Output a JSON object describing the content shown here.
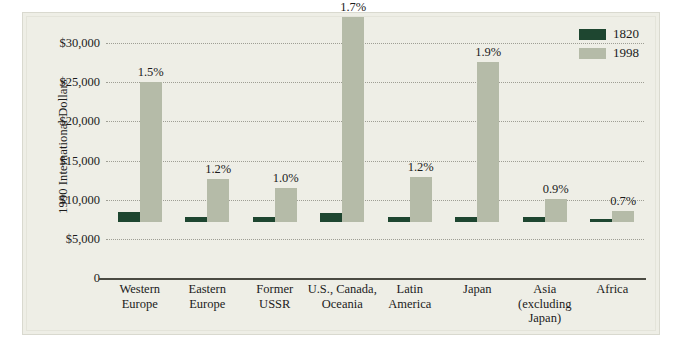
{
  "chart_data": {
    "type": "bar",
    "title": "",
    "xlabel": "",
    "ylabel": "1990 International Dollars",
    "ylim": [
      0,
      30000
    ],
    "grid": true,
    "legend_position": "top-right",
    "categories": [
      "Western Europe",
      "Eastern Europe",
      "Former USSR",
      "U.S., Canada, Oceania",
      "Latin America",
      "Japan",
      "Asia (excluding Japan)",
      "Africa"
    ],
    "category_lines": [
      [
        "Western",
        "Europe"
      ],
      [
        "Eastern",
        "Europe"
      ],
      [
        "Former",
        "USSR"
      ],
      [
        "U.S., Canada,",
        "Oceania"
      ],
      [
        "Latin",
        "America"
      ],
      [
        "Japan"
      ],
      [
        "Asia",
        "(excluding",
        "Japan)"
      ],
      [
        "Africa"
      ]
    ],
    "series": [
      {
        "name": "1820",
        "color": "#1e4630",
        "values": [
          1232,
          683,
          688,
          1201,
          692,
          669,
          577,
          418
        ]
      },
      {
        "name": "1998",
        "color": "#b5bba8",
        "values": [
          17921,
          5461,
          4354,
          26146,
          5795,
          20413,
          2936,
          1368
        ]
      }
    ],
    "annotations": [
      "1.5%",
      "1.2%",
      "1.0%",
      "1.7%",
      "1.2%",
      "1.9%",
      "0.9%",
      "0.7%"
    ],
    "yticks": [
      {
        "value": 30000,
        "label": "$30,000"
      },
      {
        "value": 25000,
        "label": "$25,000"
      },
      {
        "value": 20000,
        "label": "$20,000"
      },
      {
        "value": 15000,
        "label": "$15,000"
      },
      {
        "value": 10000,
        "label": "$10,000"
      },
      {
        "value": 5000,
        "label": "$5,000"
      },
      {
        "value": 0,
        "label": "0"
      }
    ]
  },
  "legend": {
    "items": [
      {
        "label": "1820",
        "color": "#1e4630"
      },
      {
        "label": "1998",
        "color": "#b5bba8"
      }
    ]
  },
  "axis": {
    "y_title": "1990 International Dollars"
  }
}
